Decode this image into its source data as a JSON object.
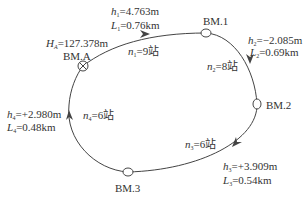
{
  "diagram": {
    "type": "closed leveling route",
    "start": {
      "name": "BM.A",
      "height_label": "H",
      "height_sub": "A",
      "height_value": "=127.378m"
    },
    "benchmarks": [
      "BM.A",
      "BM.1",
      "BM.2",
      "BM.3"
    ],
    "segments": [
      {
        "from": "BM.A",
        "to": "BM.1",
        "h_var": "h",
        "h_sub": "1",
        "h_value": "=4.763m",
        "L_var": "L",
        "L_sub": "1",
        "L_value": "=0.76km",
        "n_var": "n",
        "n_sub": "1",
        "n_value": "=9站"
      },
      {
        "from": "BM.1",
        "to": "BM.2",
        "h_var": "h",
        "h_sub": "2",
        "h_value": "=−2.085m",
        "L_var": "L",
        "L_sub": "2",
        "L_value": "=0.69km",
        "n_var": "n",
        "n_sub": "2",
        "n_value": "=8站"
      },
      {
        "from": "BM.2",
        "to": "BM.3",
        "h_var": "h",
        "h_sub": "3",
        "h_value": "=+3.909m",
        "L_var": "L",
        "L_sub": "3",
        "L_value": "=0.54km",
        "n_var": "n",
        "n_sub": "3",
        "n_value": "=6站"
      },
      {
        "from": "BM.3",
        "to": "BM.A",
        "h_var": "h",
        "h_sub": "4",
        "h_value": "=+2.980m",
        "L_var": "L",
        "L_sub": "4",
        "L_value": "=0.48km",
        "n_var": "n",
        "n_sub": "4",
        "n_value": "=6站"
      }
    ],
    "colors": {
      "line": "#444444",
      "text": "#333333",
      "background": "#ffffff"
    }
  }
}
